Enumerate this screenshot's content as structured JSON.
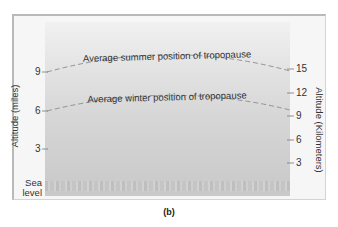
{
  "figure": {
    "panel_label": "(b)",
    "left_axis": {
      "title": "Altitude (miles)",
      "ticks": [
        {
          "label": "9",
          "y": 72
        },
        {
          "label": "6",
          "y": 111
        },
        {
          "label": "3",
          "y": 149
        }
      ],
      "sea_level_line1": "Sea",
      "sea_level_line2": "level"
    },
    "right_axis": {
      "title": "Altitude (Kilometers)",
      "ticks": [
        {
          "label": "15",
          "y": 69
        },
        {
          "label": "12",
          "y": 93
        },
        {
          "label": "9",
          "y": 116
        },
        {
          "label": "6",
          "y": 140
        },
        {
          "label": "3",
          "y": 163
        }
      ]
    },
    "curves": {
      "summer": {
        "label": "Average summer position of tropopause",
        "endpoint_miles": 9,
        "endpoint_km": 15
      },
      "winter": {
        "label": "Average winter position of tropopause",
        "endpoint_miles": 6,
        "endpoint_km": 10
      }
    },
    "colors": {
      "sky_top": "#f1f1f1",
      "sky_bottom": "#c9c9c9",
      "dash": "#8a8a8a",
      "frame_border": "#b9b9b9"
    }
  }
}
